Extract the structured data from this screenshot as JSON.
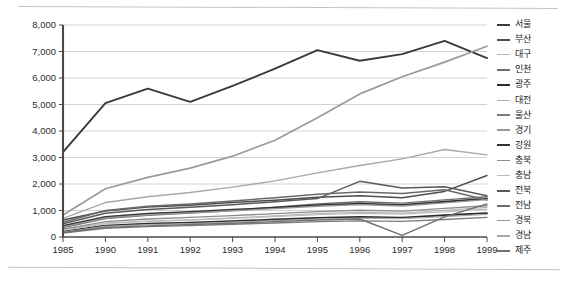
{
  "chart_data": {
    "type": "line",
    "title": "",
    "subtitle": "",
    "xlabel": "",
    "ylabel": "",
    "x": [
      "1985",
      "1990",
      "1991",
      "1992",
      "1993",
      "1994",
      "1995",
      "1996",
      "1997",
      "1998",
      "1999"
    ],
    "ylim": [
      0,
      8000
    ],
    "yticks": [
      0,
      1000,
      2000,
      3000,
      4000,
      5000,
      6000,
      7000,
      8000
    ],
    "ytick_labels": [
      "0",
      "1,000",
      "2,000",
      "3,000",
      "4,000",
      "5,000",
      "6,000",
      "7,000",
      "8,000"
    ],
    "grid": "horizontal",
    "legend_position": "right",
    "series": [
      {
        "name": "서울",
        "color": "#3a3a3a",
        "width": 1.9,
        "values": [
          3200,
          5050,
          5600,
          5100,
          5700,
          6350,
          7050,
          6650,
          6900,
          7400,
          6750
        ]
      },
      {
        "name": "부산",
        "color": "#4d4d4d",
        "width": 1.5,
        "values": [
          640,
          980,
          1130,
          1200,
          1300,
          1390,
          1500,
          1560,
          1480,
          1720,
          2320
        ]
      },
      {
        "name": "대구",
        "color": "#b4b4b4",
        "width": 1.2,
        "values": [
          300,
          520,
          600,
          650,
          720,
          800,
          880,
          930,
          900,
          1010,
          1120
        ]
      },
      {
        "name": "인천",
        "color": "#6e6e6e",
        "width": 1.4,
        "values": [
          360,
          700,
          820,
          900,
          1000,
          1120,
          1250,
          1330,
          1280,
          1400,
          1520
        ]
      },
      {
        "name": "광주",
        "color": "#2b2b2b",
        "width": 1.8,
        "values": [
          210,
          430,
          500,
          540,
          600,
          660,
          720,
          760,
          730,
          820,
          900
        ]
      },
      {
        "name": "대전",
        "color": "#aeaeae",
        "width": 1.2,
        "values": [
          190,
          400,
          470,
          510,
          560,
          620,
          680,
          710,
          690,
          770,
          850
        ]
      },
      {
        "name": "울산",
        "color": "#7d7d7d",
        "width": 1.4,
        "values": [
          150,
          330,
          390,
          430,
          480,
          530,
          580,
          610,
          590,
          660,
          740
        ]
      },
      {
        "name": "경기",
        "color": "#9a9a9a",
        "width": 1.7,
        "values": [
          830,
          1820,
          2250,
          2600,
          3050,
          3650,
          4500,
          5400,
          6050,
          6600,
          7200
        ]
      },
      {
        "name": "강원",
        "color": "#333333",
        "width": 1.8,
        "values": [
          420,
          760,
          880,
          950,
          1030,
          1110,
          1200,
          1260,
          1210,
          1330,
          1450
        ]
      },
      {
        "name": "충북",
        "color": "#8c8c8c",
        "width": 1.3,
        "values": [
          300,
          580,
          680,
          740,
          810,
          880,
          960,
          1010,
          980,
          1080,
          1180
        ]
      },
      {
        "name": "충남",
        "color": "#bdbdbd",
        "width": 1.2,
        "values": [
          250,
          500,
          590,
          640,
          700,
          770,
          840,
          890,
          860,
          950,
          1050
        ]
      },
      {
        "name": "전북",
        "color": "#5a5a5a",
        "width": 1.5,
        "values": [
          500,
          900,
          1040,
          1120,
          1220,
          1330,
          1450,
          2100,
          1850,
          1900,
          1560
        ]
      },
      {
        "name": "전남",
        "color": "#6a6a6a",
        "width": 1.5,
        "values": [
          560,
          1000,
          1160,
          1250,
          1360,
          1480,
          1610,
          1700,
          1640,
          1780,
          1400
        ]
      },
      {
        "name": "경북",
        "color": "#979797",
        "width": 1.3,
        "values": [
          380,
          720,
          840,
          910,
          990,
          1070,
          1160,
          1220,
          1170,
          1290,
          1410
        ]
      },
      {
        "name": "경남",
        "color": "#a8a8a8",
        "width": 1.4,
        "values": [
          700,
          1300,
          1520,
          1680,
          1880,
          2120,
          2420,
          2700,
          2950,
          3300,
          3100
        ]
      },
      {
        "name": "제주",
        "color": "#707070",
        "width": 1.4,
        "values": [
          170,
          360,
          420,
          470,
          520,
          580,
          640,
          680,
          60,
          760,
          1250
        ]
      }
    ]
  },
  "legend": {
    "items": [
      {
        "label": "서울"
      },
      {
        "label": "부산"
      },
      {
        "label": "대구"
      },
      {
        "label": "인천"
      },
      {
        "label": "광주"
      },
      {
        "label": "대전"
      },
      {
        "label": "울산"
      },
      {
        "label": "경기"
      },
      {
        "label": "강원"
      },
      {
        "label": "충북"
      },
      {
        "label": "충남"
      },
      {
        "label": "전북"
      },
      {
        "label": "전남"
      },
      {
        "label": "경북"
      },
      {
        "label": "경남"
      },
      {
        "label": "제주"
      }
    ]
  },
  "style": {
    "axis_color": "#4a4a4a",
    "grid_color": "#c8c8c8",
    "background": "#ffffff"
  }
}
